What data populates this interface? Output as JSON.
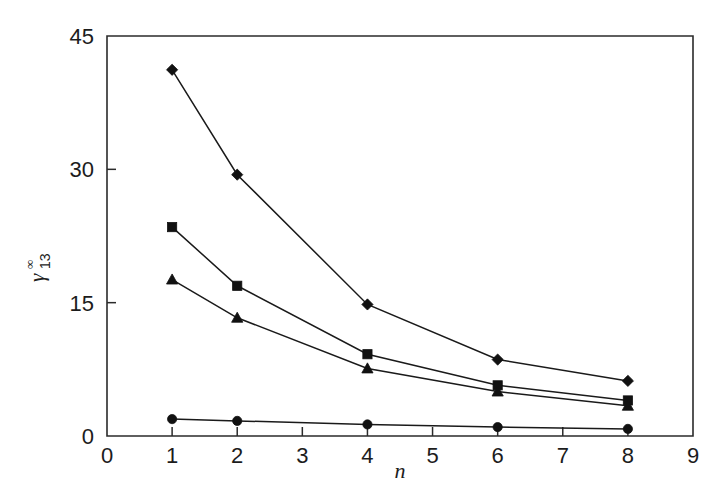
{
  "chart_data": {
    "type": "line",
    "title": "",
    "subtitle": "",
    "xlabel": "n",
    "ylabel": "γ",
    "ylabel_superscript": "∞",
    "ylabel_subscript": "13",
    "x": [
      1,
      2,
      4,
      6,
      8
    ],
    "xlim": [
      0,
      9
    ],
    "ylim": [
      0,
      45
    ],
    "xticks": [
      "0",
      "1",
      "2",
      "3",
      "4",
      "5",
      "6",
      "7",
      "8",
      "9"
    ],
    "xtick_values": [
      0,
      1,
      2,
      3,
      4,
      5,
      6,
      7,
      8,
      9
    ],
    "yticks": [
      "0",
      "15",
      "30",
      "45"
    ],
    "ytick_values": [
      0,
      15,
      30,
      45
    ],
    "grid": false,
    "legend": false,
    "legend_position": "none",
    "series": [
      {
        "name": "series-diamond",
        "marker": "diamond",
        "x": [
          1,
          2,
          4,
          6,
          8
        ],
        "values": [
          41.2,
          29.4,
          14.8,
          8.6,
          6.2
        ]
      },
      {
        "name": "series-square",
        "marker": "square",
        "x": [
          1,
          2,
          4,
          6,
          8
        ],
        "values": [
          23.5,
          16.9,
          9.2,
          5.7,
          4.0
        ]
      },
      {
        "name": "series-triangle",
        "marker": "triangle",
        "x": [
          1,
          2,
          4,
          6,
          8
        ],
        "values": [
          17.6,
          13.3,
          7.6,
          5.0,
          3.4
        ]
      },
      {
        "name": "series-circle",
        "marker": "circle",
        "x": [
          1,
          2,
          4,
          6,
          8
        ],
        "values": [
          1.9,
          1.7,
          1.3,
          1.0,
          0.8
        ]
      }
    ]
  }
}
